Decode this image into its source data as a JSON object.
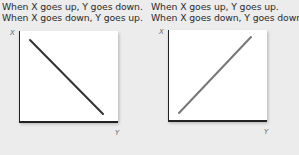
{
  "panels": [
    {
      "caption_lines": [
        "When X goes up, Y goes down.",
        "When X goes down, Y goes up."
      ],
      "x_axis_label": "X",
      "y_axis_label": "Y",
      "relationship": "negative",
      "line_color": "#333333"
    },
    {
      "caption_lines": [
        "When X goes up, Y goes up.",
        "When X goes down, Y goes down."
      ],
      "x_axis_label": "X",
      "y_axis_label": "Y",
      "relationship": "positive",
      "line_color": "#777777"
    }
  ]
}
